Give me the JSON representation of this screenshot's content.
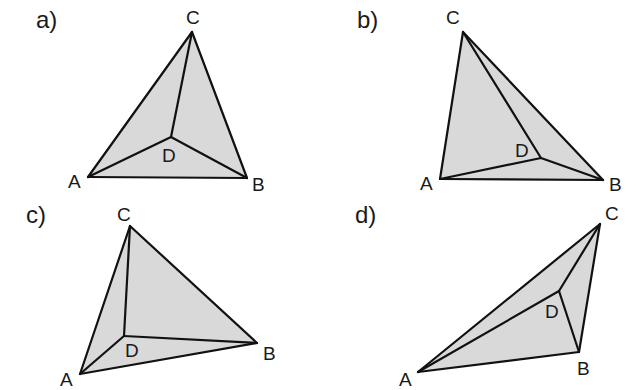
{
  "colors": {
    "fill": "#d9d9d9",
    "stroke": "#111111",
    "text": "#1a1a1a"
  },
  "panels": [
    {
      "label": "a)",
      "vertices": {
        "A": {
          "label": "A"
        },
        "B": {
          "label": "B"
        },
        "C": {
          "label": "C"
        },
        "D": {
          "label": "D"
        }
      },
      "edges": [
        "AB",
        "BC",
        "CA",
        "DA",
        "DB",
        "DC"
      ]
    },
    {
      "label": "b)",
      "vertices": {
        "A": {
          "label": "A"
        },
        "B": {
          "label": "B"
        },
        "C": {
          "label": "C"
        },
        "D": {
          "label": "D"
        }
      },
      "edges": [
        "AB",
        "BC",
        "CA",
        "DA",
        "DB",
        "DC"
      ]
    },
    {
      "label": "c)",
      "vertices": {
        "A": {
          "label": "A"
        },
        "B": {
          "label": "B"
        },
        "C": {
          "label": "C"
        },
        "D": {
          "label": "D"
        }
      },
      "edges": [
        "AB",
        "BC",
        "CA",
        "DA",
        "DB",
        "DC"
      ]
    },
    {
      "label": "d)",
      "vertices": {
        "A": {
          "label": "A"
        },
        "B": {
          "label": "B"
        },
        "C": {
          "label": "C"
        },
        "D": {
          "label": "D"
        }
      },
      "edges": [
        "AB",
        "BC",
        "CA",
        "DA",
        "DB",
        "DC"
      ]
    }
  ]
}
